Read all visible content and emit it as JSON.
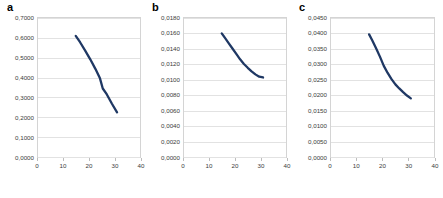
{
  "figure": {
    "background": "#ffffff",
    "line_color": "#1f3864",
    "grid_color": "#e2e2e2",
    "border_color": "#d4d4d4",
    "tick_label_color": "#3b3b3b",
    "panel_count": 3
  },
  "panels": [
    {
      "letter": "a"
    },
    {
      "letter": "b"
    },
    {
      "letter": "c"
    }
  ],
  "chart_data": [
    {
      "type": "line",
      "panel": "a",
      "title": "a",
      "xlabel": "",
      "ylabel": "",
      "xlim": [
        0,
        40
      ],
      "ylim": [
        0.0,
        0.7
      ],
      "grid": true,
      "legend": "none",
      "xticks": [
        0,
        10,
        20,
        30,
        40
      ],
      "xticklabels": [
        "0",
        "10",
        "20",
        "30",
        "40"
      ],
      "yticks": [
        0.0,
        0.1,
        0.2,
        0.3,
        0.4,
        0.5,
        0.6,
        0.7
      ],
      "yticklabels": [
        "0,0000",
        "0,1000",
        "0,2000",
        "0,3000",
        "0,4000",
        "0,5000",
        "0,6000",
        "0,7000"
      ],
      "series": [
        {
          "name": "series-a",
          "color": "#1f3864",
          "x": [
            14.8,
            16.5,
            18.5,
            20.5,
            22.5,
            24.3,
            25.4,
            27.0,
            29.0,
            31.0
          ],
          "y": [
            0.61,
            0.578,
            0.536,
            0.492,
            0.444,
            0.396,
            0.345,
            0.315,
            0.268,
            0.225
          ]
        }
      ]
    },
    {
      "type": "line",
      "panel": "b",
      "title": "b",
      "xlabel": "",
      "ylabel": "",
      "xlim": [
        0,
        40
      ],
      "ylim": [
        0.0,
        0.018
      ],
      "grid": true,
      "legend": "none",
      "xticks": [
        0,
        10,
        20,
        30,
        40
      ],
      "xticklabels": [
        "0",
        "10",
        "20",
        "30",
        "40"
      ],
      "yticks": [
        0.0,
        0.002,
        0.004,
        0.006,
        0.008,
        0.01,
        0.012,
        0.014,
        0.016,
        0.018
      ],
      "yticklabels": [
        "0,0000",
        "0,0020",
        "0,0040",
        "0,0060",
        "0,0080",
        "0,0100",
        "0,0120",
        "0,0140",
        "0,0160",
        "0,0180"
      ],
      "series": [
        {
          "name": "series-b",
          "color": "#1f3864",
          "x": [
            14.8,
            16.0,
            17.5,
            19.0,
            20.5,
            22.0,
            23.5,
            25.0,
            26.5,
            28.0,
            29.5,
            31.0
          ],
          "y": [
            0.016,
            0.01545,
            0.01475,
            0.01405,
            0.01335,
            0.01265,
            0.01205,
            0.01155,
            0.0111,
            0.0107,
            0.0104,
            0.0103
          ]
        }
      ]
    },
    {
      "type": "line",
      "panel": "c",
      "title": "c",
      "xlabel": "",
      "ylabel": "",
      "xlim": [
        0,
        40
      ],
      "ylim": [
        0.0,
        0.045
      ],
      "grid": true,
      "legend": "none",
      "xticks": [
        0,
        10,
        20,
        30,
        40
      ],
      "xticklabels": [
        "0",
        "10",
        "20",
        "30",
        "40"
      ],
      "yticks": [
        0.0,
        0.005,
        0.01,
        0.015,
        0.02,
        0.025,
        0.03,
        0.035,
        0.04,
        0.045
      ],
      "yticklabels": [
        "0,0000",
        "0,0050",
        "0,0100",
        "0,0150",
        "0,0200",
        "0,0250",
        "0,0300",
        "0,0350",
        "0,0400",
        "0,0450"
      ],
      "series": [
        {
          "name": "series-c",
          "color": "#1f3864",
          "x": [
            14.8,
            16.0,
            17.5,
            19.0,
            20.5,
            22.0,
            23.5,
            25.0,
            26.5,
            28.0,
            29.5,
            31.0
          ],
          "y": [
            0.0397,
            0.0378,
            0.0352,
            0.0325,
            0.0295,
            0.0272,
            0.0252,
            0.0235,
            0.0222,
            0.021,
            0.0199,
            0.019
          ]
        }
      ]
    }
  ]
}
